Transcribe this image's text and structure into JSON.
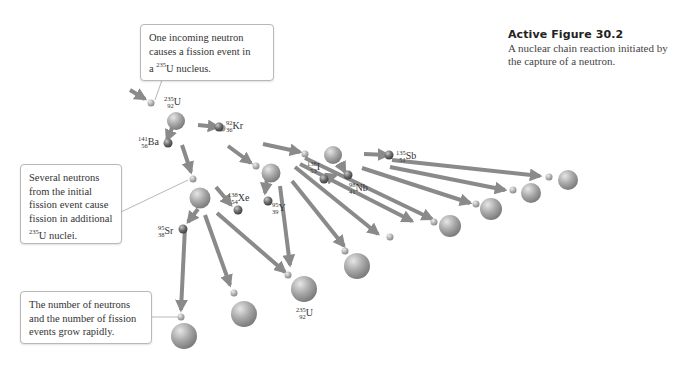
{
  "caption": {
    "title": "Active Figure 30.2",
    "text": "A nuclear chain reaction initiated by the capture of a neutron."
  },
  "callouts": [
    {
      "id": "incoming",
      "lines": [
        "One incoming neutron",
        "causes a fission event in",
        "a"
      ],
      "sup": "235",
      "tail": "U nucleus."
    },
    {
      "id": "several",
      "lines": [
        "Several neutrons",
        "from the initial",
        "fission event cause",
        "fission in additional"
      ],
      "sup": "235",
      "tail": "U nuclei."
    },
    {
      "id": "grow",
      "lines": [
        "The number of neutrons",
        "and the number of fission",
        "events grow rapidly."
      ]
    }
  ],
  "labels": [
    {
      "id": "u235-top",
      "mass": "235",
      "z": "92",
      "sym": "U"
    },
    {
      "id": "kr92",
      "mass": "92",
      "z": "36",
      "sym": "Kr"
    },
    {
      "id": "ba141",
      "mass": "141",
      "z": "56",
      "sym": "Ba"
    },
    {
      "id": "xe138",
      "mass": "138",
      "z": "54",
      "sym": "Xe"
    },
    {
      "id": "y95",
      "mass": "95",
      "z": "39",
      "sym": "Y"
    },
    {
      "id": "sr95",
      "mass": "95",
      "z": "38",
      "sym": "Sr"
    },
    {
      "id": "i138",
      "mass": "138",
      "z": "53",
      "sym": "I"
    },
    {
      "id": "nb98",
      "mass": "98",
      "z": "41",
      "sym": "Nb"
    },
    {
      "id": "sb135",
      "mass": "135",
      "z": "51",
      "sym": "Sb"
    },
    {
      "id": "u235-bottom",
      "mass": "235",
      "z": "92",
      "sym": "U"
    }
  ],
  "colors": {
    "arrow": "#8a8a8a",
    "nucleus": "#a9a9a9",
    "fragment": "#7a7a7a",
    "callout_border": "#b8b8b8"
  }
}
